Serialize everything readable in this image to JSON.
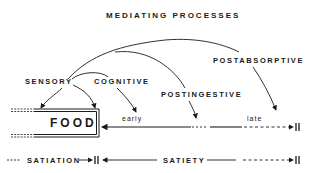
{
  "title": "MEDIATING PROCESSES",
  "processes": {
    "sensory": "SENSORY",
    "cognitive": "COGNITIVE",
    "postingestive": "POSTINGESTIVE",
    "postabsorptive": "POSTABSORPTIVE"
  },
  "food_box": {
    "label": "FOOD"
  },
  "timeline": {
    "early": "early",
    "late": "late"
  },
  "bottom": {
    "satiation": "SATIATION",
    "satiety": "SATIETY"
  },
  "colors": {
    "ink": "#1a1a1a",
    "background": "#ffffff"
  }
}
